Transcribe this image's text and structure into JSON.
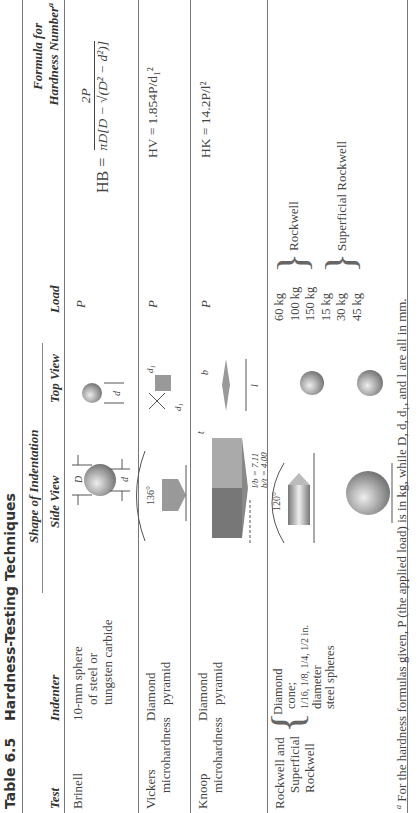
{
  "table": {
    "number": "Table 6.5",
    "title": "Hardness-Testing Techniques",
    "group_header": "Shape of Indentation",
    "columns": [
      "Test",
      "Indenter",
      "Side View",
      "Top View",
      "Load",
      "Formula for Hardness Number",
      "a"
    ],
    "rows": [
      {
        "test": "Brinell",
        "indenter": [
          "10-mm sphere",
          "of steel or",
          "tungsten carbide"
        ],
        "side_labels": {
          "D": "D",
          "d": "d"
        },
        "top_labels": {
          "d": "d"
        },
        "load": "P",
        "formula_lhs": "HB =",
        "formula_num": "2P",
        "formula_den": "πD[D − √(D² − d²)]"
      },
      {
        "test": [
          "Vickers",
          "microhardness"
        ],
        "indenter": [
          "Diamond",
          "pyramid"
        ],
        "side_labels": {
          "angle": "136°"
        },
        "top_labels": {
          "d1": "d₁"
        },
        "load": "P",
        "formula": "HV = 1.854P/d₁²"
      },
      {
        "test": [
          "Knoop",
          "microhardness"
        ],
        "indenter": [
          "Diamond",
          "pyramid"
        ],
        "side_labels": {
          "t": "t",
          "ratio1": "l/b = 7.11",
          "ratio2": "b/t = 4.00"
        },
        "top_labels": {
          "b": "b",
          "l": "l"
        },
        "load": "P",
        "formula": "HK = 14.2P/l²"
      },
      {
        "test": [
          "Rockwell and",
          "Superficial",
          "Rockwell"
        ],
        "indenter": [
          "Diamond",
          "cone;",
          "1/16, 1/8, 1/4, 1/2 in.",
          "diameter",
          "steel spheres"
        ],
        "side_labels": {
          "angle": "120°"
        },
        "loads_rockwell": [
          "60 kg",
          "100 kg",
          "150 kg"
        ],
        "loads_superficial": [
          "15 kg",
          "30 kg",
          "45 kg"
        ],
        "rockwell_label": "Rockwell",
        "superficial_label": "Superficial Rockwell"
      }
    ],
    "footnote": "For the hardness formulas given, P (the applied load) is in kg, while D, d, d₁, and l are all in mm."
  }
}
